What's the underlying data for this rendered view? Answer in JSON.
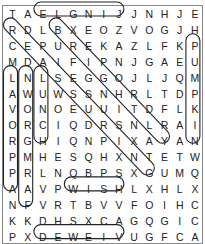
{
  "puzzle": {
    "title": "",
    "grid": [
      [
        "T",
        "A",
        "E",
        "L",
        "G",
        "N",
        "I",
        "J",
        "J",
        "N",
        "H",
        "J",
        "E"
      ],
      [
        "R",
        "D",
        "L",
        "B",
        "X",
        "E",
        "O",
        "Z",
        "V",
        "O",
        "G",
        "J",
        "H"
      ],
      [
        "C",
        "E",
        "P",
        "U",
        "R",
        "E",
        "K",
        "A",
        "Z",
        "L",
        "F",
        "K",
        "P"
      ],
      [
        "M",
        "D",
        "A",
        "I",
        "F",
        "I",
        "P",
        "N",
        "J",
        "G",
        "A",
        "E",
        "U"
      ],
      [
        "L",
        "N",
        "L",
        "S",
        "E",
        "G",
        "G",
        "O",
        "J",
        "L",
        "J",
        "Q",
        "M"
      ],
      [
        "A",
        "W",
        "U",
        "W",
        "S",
        "S",
        "N",
        "H",
        "R",
        "L",
        "T",
        "D",
        "P"
      ],
      [
        "V",
        "O",
        "N",
        "O",
        "E",
        "U",
        "U",
        "I",
        "T",
        "D",
        "F",
        "L",
        "K"
      ],
      [
        "O",
        "R",
        "C",
        "I",
        "Q",
        "D",
        "R",
        "S",
        "N",
        "L",
        "R",
        "A",
        "I"
      ],
      [
        "R",
        "G",
        "H",
        "I",
        "Q",
        "N",
        "P",
        "I",
        "X",
        "A",
        "Y",
        "A",
        "N"
      ],
      [
        "P",
        "M",
        "H",
        "E",
        "S",
        "Q",
        "H",
        "X",
        "N",
        "T",
        "E",
        "T",
        "W"
      ],
      [
        "P",
        "R",
        "L",
        "N",
        "Q",
        "B",
        "P",
        "S",
        "X",
        "G",
        "U",
        "M",
        "Q"
      ],
      [
        "A",
        "A",
        "V",
        "P",
        "W",
        "I",
        "S",
        "H",
        "L",
        "X",
        "H",
        "L",
        "X"
      ],
      [
        "N",
        "F",
        "V",
        "R",
        "T",
        "B",
        "V",
        "V",
        "F",
        "O",
        "I",
        "H",
        "C"
      ],
      [
        "K",
        "K",
        "D",
        "H",
        "S",
        "X",
        "C",
        "A",
        "G",
        "Q",
        "G",
        "I",
        "C"
      ],
      [
        "P",
        "X",
        "D",
        "E",
        "W",
        "E",
        "I",
        "V",
        "U",
        "G",
        "F",
        "C",
        "A"
      ]
    ],
    "found_words": [
      {
        "word": "JINGLE",
        "start": [
          0,
          7
        ],
        "end": [
          0,
          2
        ]
      },
      {
        "word": "APPROVAL",
        "start": [
          11,
          0
        ],
        "end": [
          4,
          0
        ]
      },
      {
        "word": "FARMGROWN",
        "start": [
          12,
          1
        ],
        "end": [
          4,
          1
        ]
      },
      {
        "word": "LUNCH",
        "start": [
          4,
          2
        ],
        "end": [
          8,
          2
        ]
      },
      {
        "word": "PUMPKIN",
        "start": [
          2,
          12
        ],
        "end": [
          8,
          12
        ]
      },
      {
        "word": "WISH",
        "start": [
          11,
          4
        ],
        "end": [
          11,
          7
        ]
      },
      {
        "word": "VIEWED",
        "start": [
          14,
          7
        ],
        "end": [
          14,
          2
        ]
      },
      {
        "word": "REASSURING",
        "start": [
          1,
          0
        ],
        "end": [
          10,
          9
        ]
      },
      {
        "word": "BRIGHTLY",
        "start": [
          1,
          3
        ],
        "end": [
          8,
          10
        ]
      }
    ]
  }
}
